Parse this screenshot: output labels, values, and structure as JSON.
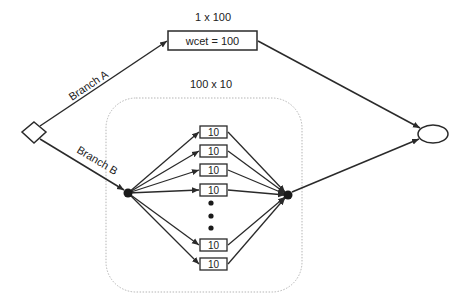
{
  "diagram": {
    "top_label": "1 x 100",
    "top_task": "wcet = 100",
    "group_label": "100 x 10",
    "branch_a": "Branch A",
    "branch_b": "Branch B",
    "parallel_tasks": [
      {
        "label": "10"
      },
      {
        "label": "10"
      },
      {
        "label": "10"
      },
      {
        "label": "10"
      },
      {
        "label": "10"
      },
      {
        "label": "10"
      }
    ],
    "ellipsis": "⋮",
    "colors": {
      "stroke": "#2a2a2a",
      "group_border": "#b0b0b0",
      "background": "#ffffff"
    }
  }
}
